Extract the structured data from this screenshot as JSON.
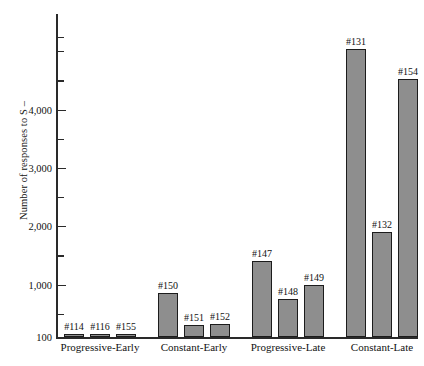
{
  "chart_data": {
    "type": "bar",
    "title": "",
    "xlabel": "",
    "ylabel": "Number of responses to S –",
    "ylim": [
      100,
      5300
    ],
    "grid": false,
    "legend": null,
    "y_tick_labels": [
      "100",
      "1,000",
      "2,000",
      "3,000",
      "4,000"
    ],
    "y_tick_values": [
      100,
      1000,
      2000,
      3000,
      4000
    ],
    "y_minor_tick_values": [
      500,
      1500,
      2500,
      3500,
      4500,
      5000,
      5250
    ],
    "categories": [
      "Progressive-Early",
      "Constant-Early",
      "Progressive-Late",
      "Constant-Late"
    ],
    "groups": [
      {
        "name": "Progressive-Early",
        "bars": [
          {
            "label": "#114",
            "value": 120
          },
          {
            "label": "#116",
            "value": 135
          },
          {
            "label": "#155",
            "value": 130
          }
        ]
      },
      {
        "name": "Constant-Early",
        "bars": [
          {
            "label": "#150",
            "value": 850
          },
          {
            "label": "#151",
            "value": 300
          },
          {
            "label": "#152",
            "value": 330
          }
        ]
      },
      {
        "name": "Progressive-Late",
        "bars": [
          {
            "label": "#147",
            "value": 1400
          },
          {
            "label": "#148",
            "value": 760
          },
          {
            "label": "#149",
            "value": 1000
          }
        ]
      },
      {
        "name": "Constant-Late",
        "bars": [
          {
            "label": "#131",
            "value": 5030
          },
          {
            "label": "#132",
            "value": 1900
          },
          {
            "label": "#154",
            "value": 4520
          }
        ]
      }
    ],
    "colors": {
      "bar_fill": "#8e8e8e",
      "bar_stroke": "#1c1c1c",
      "axis": "#2a2a2a",
      "text": "#121212",
      "background": "#ffffff"
    }
  }
}
